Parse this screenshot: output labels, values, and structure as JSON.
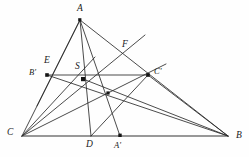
{
  "figure": {
    "width": 249,
    "height": 157,
    "background_color": "#fefefe",
    "stroke_color": "#2b2b2b",
    "label_color": "#1a1a1a"
  },
  "labels": {
    "A": "A",
    "B": "B",
    "C": "C",
    "A_prime": "A'",
    "B_prime": "B'",
    "C_prime": "C'",
    "D": "D",
    "E": "E",
    "F": "F",
    "S": "S"
  },
  "points": [
    {
      "id": "A",
      "label": "A",
      "x": 80,
      "y": 20,
      "dot": true,
      "label_x": 77,
      "label_y": 5
    },
    {
      "id": "B",
      "label": "B",
      "x": 228,
      "y": 136,
      "dot": false,
      "label_x": 236,
      "label_y": 137
    },
    {
      "id": "C",
      "label": "C",
      "x": 22,
      "y": 136,
      "dot": false,
      "label_x": 8,
      "label_y": 130
    },
    {
      "id": "Bp",
      "label": "B'",
      "x": 47,
      "y": 75,
      "dot": true,
      "label_x": 31,
      "label_y": 67
    },
    {
      "id": "S",
      "label": "S",
      "x": 83,
      "y": 79,
      "dot": true,
      "label_x": 76,
      "label_y": 62
    },
    {
      "id": "Cp",
      "label": "C'",
      "x": 148,
      "y": 75,
      "dot": true,
      "label_x": 155,
      "label_y": 67
    },
    {
      "id": "D",
      "label": "D",
      "x": 91,
      "y": 136,
      "dot": false,
      "label_x": 87,
      "label_y": 141
    },
    {
      "id": "Ap",
      "label": "A'",
      "x": 120,
      "y": 136,
      "dot": true,
      "label_x": 114,
      "label_y": 141
    },
    {
      "id": "E",
      "label": "E",
      "x": 55,
      "y": 70,
      "dot": false,
      "label_x": 46,
      "label_y": 56
    },
    {
      "id": "F",
      "label": "F",
      "x": 120,
      "y": 53,
      "dot": false,
      "label_x": 123,
      "label_y": 40
    },
    {
      "id": "X",
      "label": "",
      "x": 108,
      "y": 93,
      "dot": true,
      "label_x": 0,
      "label_y": 0
    }
  ],
  "segments": [
    {
      "name": "side-AC",
      "x1": 80,
      "y1": 20,
      "x2": 22,
      "y2": 136,
      "kind": "side"
    },
    {
      "name": "side-AB",
      "x1": 80,
      "y1": 20,
      "x2": 228,
      "y2": 136,
      "kind": "side"
    },
    {
      "name": "side-CB",
      "x1": 22,
      "y1": 136,
      "x2": 228,
      "y2": 136,
      "kind": "base"
    },
    {
      "name": "cevian-A-to-D",
      "x1": 80,
      "y1": 20,
      "x2": 91,
      "y2": 136,
      "kind": "cevian"
    },
    {
      "name": "cevian-A-to-Aprime",
      "x1": 80,
      "y1": 20,
      "x2": 120,
      "y2": 136,
      "kind": "cevian"
    },
    {
      "name": "cevian-A-to-Bprime-ext",
      "x1": 80,
      "y1": 20,
      "x2": 40,
      "y2": 100,
      "kind": "cevian"
    },
    {
      "name": "cevian-C-to-F",
      "x1": 22,
      "y1": 136,
      "x2": 143,
      "y2": 37,
      "kind": "cevian"
    },
    {
      "name": "cevian-C-to-Cprime-B",
      "x1": 22,
      "y1": 136,
      "x2": 228,
      "y2": 136,
      "kind": "none"
    },
    {
      "name": "line-Bprime-to-B",
      "x1": 47,
      "y1": 75,
      "x2": 228,
      "y2": 136,
      "kind": "cevian"
    },
    {
      "name": "line-S-to-B",
      "x1": 83,
      "y1": 79,
      "x2": 228,
      "y2": 136,
      "kind": "cevian"
    },
    {
      "name": "line-C-to-Cprime",
      "x1": 22,
      "y1": 136,
      "x2": 163,
      "y2": 66,
      "kind": "cevian"
    },
    {
      "name": "line-Cprime-to-B",
      "x1": 148,
      "y1": 75,
      "x2": 228,
      "y2": 136,
      "kind": "cevian"
    },
    {
      "name": "line-Bprime-to-Cprime",
      "x1": 47,
      "y1": 75,
      "x2": 148,
      "y2": 75,
      "kind": "cevian"
    },
    {
      "name": "line-C-to-S-ext",
      "x1": 22,
      "y1": 136,
      "x2": 120,
      "y2": 53,
      "kind": "cevian"
    },
    {
      "name": "line-Cprime-to-D",
      "x1": 148,
      "y1": 75,
      "x2": 91,
      "y2": 136,
      "kind": "cevian"
    }
  ],
  "notes": {
    "shape": "triangle",
    "vertex_count": 3,
    "marked_point_count": 5
  }
}
